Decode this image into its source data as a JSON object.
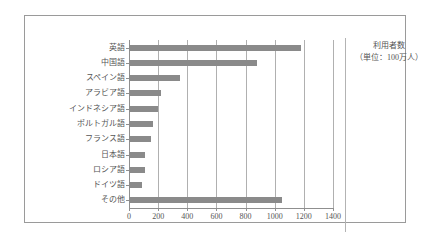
{
  "chart_data": {
    "type": "bar",
    "orientation": "horizontal",
    "title": "",
    "xlabel": "",
    "ylabel": "",
    "legend_position": "right",
    "grid": true,
    "xlim": [
      0,
      1400
    ],
    "xticks": [
      0,
      200,
      400,
      600,
      800,
      1000,
      1200,
      1400
    ],
    "xtick_labels": [
      "0",
      "200",
      "400",
      "600",
      "800",
      "1000",
      "1200",
      "1400"
    ],
    "categories": [
      "英語",
      "中国語",
      "スペイン語",
      "アラビア語",
      "インドネシア語",
      "ポルトガル語",
      "フランス語",
      "日本語",
      "ロシア語",
      "ドイツ語",
      "その他"
    ],
    "values": [
      1180,
      880,
      350,
      220,
      200,
      165,
      150,
      110,
      110,
      90,
      1050
    ],
    "unit_note": "利用者数（単位：100万人）",
    "bar_color": "#8a8a8a",
    "grid_color": "#b0b0b0",
    "frame_color": "#9a9a9a",
    "text_color": "#555555"
  },
  "legend": {
    "line1": "利用者数",
    "line2": "（単位：100万人）"
  }
}
